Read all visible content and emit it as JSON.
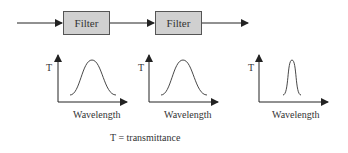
{
  "pipeline": {
    "filters": [
      {
        "label": "Filter"
      },
      {
        "label": "Filter"
      }
    ],
    "colors": {
      "box_fill": "#d0d0d0",
      "box_border": "#555555",
      "line": "#222222"
    }
  },
  "graphs": [
    {
      "y_label": "T",
      "x_label": "Wavelength",
      "peak": "broad"
    },
    {
      "y_label": "T",
      "x_label": "Wavelength",
      "peak": "broad"
    },
    {
      "y_label": "T",
      "x_label": "Wavelength",
      "peak": "narrow"
    }
  ],
  "legend": {
    "text": "T = transmittance"
  }
}
